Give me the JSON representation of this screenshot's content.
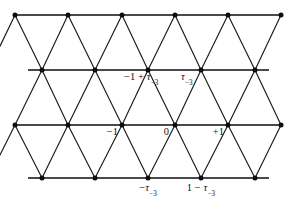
{
  "figure": {
    "width": 296,
    "height": 202,
    "background_color": "#ffffff",
    "edge_color": "#1a1a1a",
    "rail_color": "#4a4a4a",
    "node_color": "#0d0d0d",
    "label_color": "#111111"
  },
  "chart_data": {
    "type": "diagram",
    "subtype": "triangular-lattice",
    "title": "",
    "xlabel": "",
    "ylabel": "",
    "grid": true,
    "legend": null,
    "row_y": [
      15,
      70,
      125,
      178
    ],
    "node_spacing_x": 53,
    "row_offset_x": 26.5,
    "rows": [
      {
        "index": 0,
        "y": 15,
        "node_x": [
          15,
          68,
          122,
          175,
          228,
          281
        ]
      },
      {
        "index": 1,
        "y": 70,
        "node_x": [
          42,
          95,
          148,
          201,
          255
        ]
      },
      {
        "index": 2,
        "y": 125,
        "node_x": [
          15,
          68,
          122,
          175,
          228,
          281
        ]
      },
      {
        "index": 3,
        "y": 178,
        "node_x": [
          42,
          95,
          148,
          201,
          255
        ]
      }
    ],
    "labels": [
      {
        "text": "-1 + τ₋₃",
        "base": "-1 + ",
        "tau": "τ",
        "subscript": "-3",
        "x": 122,
        "y": 70,
        "anchor": "right-below"
      },
      {
        "text": "τ₋₃",
        "base": "",
        "tau": "τ",
        "subscript": "-3",
        "x": 175,
        "y": 70,
        "anchor": "right-below"
      },
      {
        "text": "-1",
        "base": "-1",
        "tau": "",
        "subscript": "",
        "x": 122,
        "y": 125,
        "anchor": "left-below"
      },
      {
        "text": "0",
        "base": "0",
        "tau": "",
        "subscript": "",
        "x": 175,
        "y": 125,
        "anchor": "left-below"
      },
      {
        "text": "+1",
        "base": "+1",
        "tau": "",
        "subscript": "",
        "x": 228,
        "y": 125,
        "anchor": "left-below"
      },
      {
        "text": "-τ₋₃",
        "base": "-",
        "tau": "τ",
        "subscript": "-3",
        "x": 148,
        "y": 178,
        "anchor": "center-below"
      },
      {
        "text": "1 - τ₋₃",
        "base": "1 - ",
        "tau": "τ",
        "subscript": "-3",
        "x": 201,
        "y": 178,
        "anchor": "center-below"
      }
    ]
  },
  "labels": {
    "minus_one_plus_tau": {
      "prefix": "−1 + ",
      "tau": "τ",
      "sub": "−3"
    },
    "tau": {
      "prefix": "",
      "tau": "τ",
      "sub": "−3"
    },
    "minus_one": {
      "text": "−1"
    },
    "zero": {
      "text": "0"
    },
    "plus_one": {
      "text": "+1"
    },
    "minus_tau": {
      "prefix": "−",
      "tau": "τ",
      "sub": "−3"
    },
    "one_minus_tau": {
      "prefix": "1 − ",
      "tau": "τ",
      "sub": "−3"
    }
  }
}
